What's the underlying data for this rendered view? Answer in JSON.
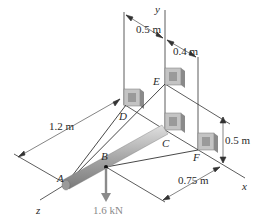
{
  "diagram": {
    "axes": {
      "x": "x",
      "y": "y",
      "z": "z"
    },
    "points": {
      "A": "A",
      "B": "B",
      "C": "C",
      "D": "D",
      "E": "E",
      "F": "F"
    },
    "dimensions": {
      "ad": "1.2 m",
      "top_left": "0.5 m",
      "top_right": "0.4 m",
      "height": "0.5 m",
      "bottom": "0.75 m"
    },
    "load": {
      "value": "1.6 kN",
      "at": "B",
      "direction": "down"
    },
    "colors": {
      "line": "#333333",
      "rod": "#b8b8b8",
      "bracket": "#a8a8a8",
      "force": "#8a8a8a"
    }
  }
}
